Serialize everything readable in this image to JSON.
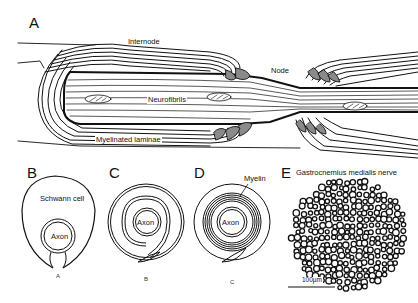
{
  "figure": {
    "panels": [
      {
        "id": "A",
        "letter": "A",
        "title": "Myelinated nerve fiber longitudinal section",
        "labels": {
          "internode": "Internode",
          "node": "Node",
          "neurofibrils": "Neurofibrils",
          "myelinated_laminae": "Myelinated laminae"
        }
      },
      {
        "id": "B",
        "letter": "B",
        "labels": {
          "schwann_cell": "Schwann cell",
          "axon": "Axon"
        },
        "sub_caption": "A"
      },
      {
        "id": "C",
        "letter": "C",
        "labels": {
          "axon": "Axon"
        },
        "sub_caption": "B"
      },
      {
        "id": "D",
        "letter": "D",
        "labels": {
          "myelin": "Myelin",
          "axon": "Axon"
        },
        "sub_caption": "C"
      },
      {
        "id": "E",
        "letter": "E",
        "labels": {
          "title": "Gastrocnemius medialis nerve",
          "scale_bar": "100µm"
        }
      }
    ]
  },
  "colors": {
    "ink": "#111111",
    "shade": "#8a8a8a",
    "background": "#ffffff"
  }
}
